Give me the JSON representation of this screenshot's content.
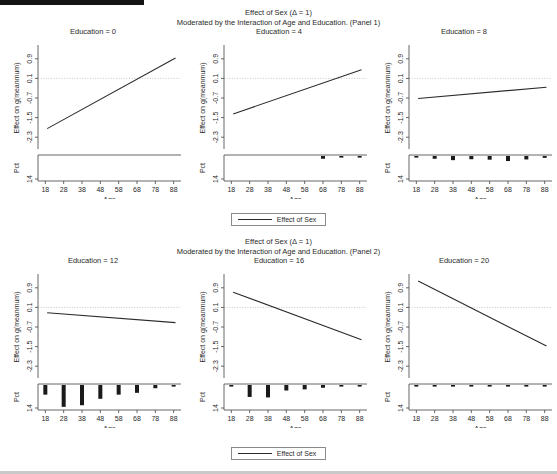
{
  "figure": {
    "title_line1": "Effect of Sex (Δ = 1)",
    "panel1_title_line2": "Moderated by  the Interaction of Age  and Education. (Panel 1)",
    "panel2_title_line2": "Moderated by  the Interaction of Age  and Education. (Panel 2)",
    "legend_label": "Effect of Sex",
    "line_color": "#2b2b2b",
    "bar_color": "#1a1a1a",
    "ref_line_color": "#b9b9b9",
    "axis_color": "#555555"
  },
  "chart_data": {
    "type": "line",
    "title": "Effect of Sex (Δ = 1) Moderated by the Interaction of Age and Education.",
    "xlabel": "Age",
    "ylabel": "Effect on g(meanmum)",
    "y2label": "Pct",
    "xlim": [
      14,
      92
    ],
    "ylim": [
      -2.7,
      1.3
    ],
    "yticks": [
      0.9,
      0.1,
      -0.7,
      -1.5,
      -2.3
    ],
    "ytick_labels": [
      "0.9",
      "0.1",
      "-0.7",
      "-1.5",
      "-2.3"
    ],
    "xticks": [
      18,
      28,
      38,
      48,
      58,
      68,
      78,
      88
    ],
    "xtick_labels": [
      "18",
      "28",
      "38",
      "48",
      "58",
      "68",
      "78",
      "88"
    ],
    "pct_ticks": [
      14
    ],
    "pct_tick_labels": [
      "14"
    ],
    "reference_line_y": 0.1,
    "grid": false,
    "legend_position": "bottom-center",
    "legend_entries": [
      "Effect of Sex"
    ],
    "facet_variable": "Education",
    "panels": [
      {
        "panel_label": "Panel 1",
        "facets": [
          {
            "title": "Education = 0",
            "education": 0,
            "series": {
              "name": "Effect of Sex",
              "x": [
                19,
                89
              ],
              "y": [
                -1.95,
                0.93
              ]
            },
            "histogram": {
              "x": [
                18,
                28,
                38,
                48,
                58,
                68,
                78,
                88
              ],
              "pct": [
                0,
                0,
                0,
                0,
                0,
                0,
                0,
                0
              ]
            }
          },
          {
            "title": "Education = 4",
            "education": 4,
            "series": {
              "name": "Effect of Sex",
              "x": [
                19,
                89
              ],
              "y": [
                -1.35,
                0.45
              ]
            },
            "histogram": {
              "x": [
                18,
                28,
                38,
                48,
                58,
                68,
                78,
                88
              ],
              "pct": [
                0,
                0,
                0,
                0,
                0,
                1.2,
                0.6,
                0.6
              ]
            }
          },
          {
            "title": "Education = 8",
            "education": 8,
            "series": {
              "name": "Effect of Sex",
              "x": [
                19,
                89
              ],
              "y": [
                -0.72,
                -0.26
              ]
            },
            "histogram": {
              "x": [
                18,
                28,
                38,
                48,
                58,
                68,
                78,
                88
              ],
              "pct": [
                0.5,
                1.2,
                1.8,
                1.4,
                1.6,
                2.2,
                1.5,
                0.8
              ]
            }
          }
        ]
      },
      {
        "panel_label": "Panel 2",
        "facets": [
          {
            "title": "Education = 12",
            "education": 12,
            "series": {
              "name": "Effect of Sex",
              "x": [
                19,
                89
              ],
              "y": [
                -0.12,
                -0.52
              ]
            },
            "histogram": {
              "x": [
                18,
                28,
                38,
                48,
                58,
                68,
                78,
                88
              ],
              "pct": [
                4.2,
                9.5,
                8.8,
                6.0,
                4.2,
                3.4,
                1.4,
                0.3
              ]
            }
          },
          {
            "title": "Education = 16",
            "education": 16,
            "series": {
              "name": "Effect of Sex",
              "x": [
                19,
                89
              ],
              "y": [
                0.72,
                -1.22
              ]
            },
            "histogram": {
              "x": [
                18,
                28,
                38,
                48,
                58,
                68,
                78,
                88
              ],
              "pct": [
                0.6,
                5.2,
                5.4,
                2.4,
                1.9,
                1.2,
                0.3,
                0.2
              ]
            }
          },
          {
            "title": "Education = 20",
            "education": 20,
            "series": {
              "name": "Effect of Sex",
              "x": [
                19,
                89
              ],
              "y": [
                1.18,
                -1.48
              ]
            },
            "histogram": {
              "x": [
                18,
                28,
                38,
                48,
                58,
                68,
                78,
                88
              ],
              "pct": [
                0.3,
                0.5,
                0.5,
                0.4,
                0.3,
                0.3,
                0.2,
                0.1
              ]
            }
          }
        ]
      }
    ]
  }
}
